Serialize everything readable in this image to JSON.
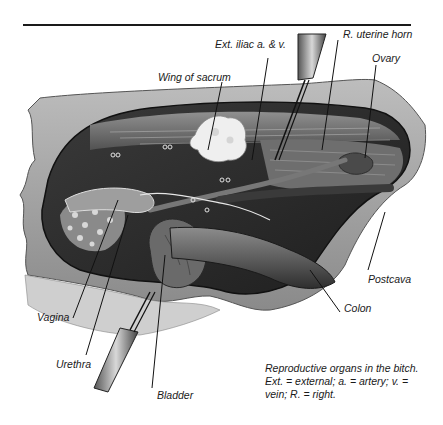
{
  "figure": {
    "type": "anatomical-illustration",
    "subject": "Reproductive organs in the bitch",
    "labels": [
      {
        "id": "ext-iliac",
        "text": "Ext. iliac a. & v."
      },
      {
        "id": "r-uterine-horn",
        "text": "R. uterine horn"
      },
      {
        "id": "ovary",
        "text": "Ovary"
      },
      {
        "id": "wing-of-sacrum",
        "text": "Wing of sacrum"
      },
      {
        "id": "postcava",
        "text": "Postcava"
      },
      {
        "id": "colon",
        "text": "Colon"
      },
      {
        "id": "vagina",
        "text": "Vagina"
      },
      {
        "id": "urethra",
        "text": "Urethra"
      },
      {
        "id": "bladder",
        "text": "Bladder"
      }
    ],
    "caption": {
      "line1": "Reproductive organs in the bitch.",
      "line2": "Ext. = external; a. = artery; v. =",
      "line3": "vein; R. = right."
    }
  }
}
